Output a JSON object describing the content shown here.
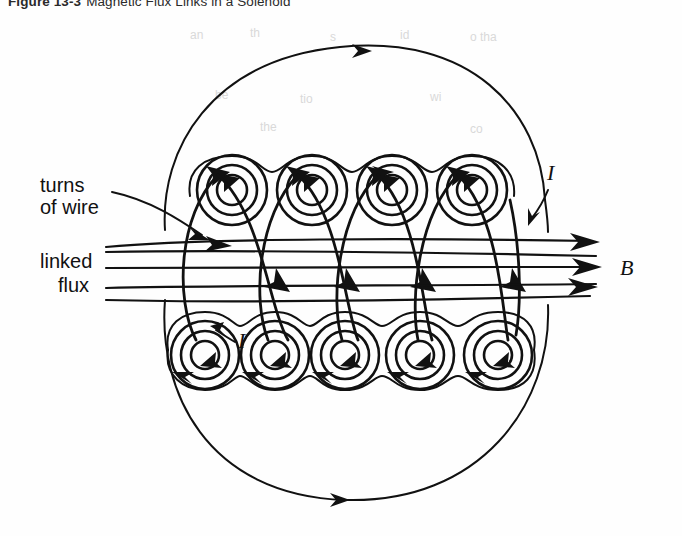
{
  "figure": {
    "number": "Figure 13-3",
    "caption": "Magnetic Flux Links in a Solenoid"
  },
  "labels": {
    "turns_line1": "turns",
    "turns_line2": "of wire",
    "linked_line1": "linked",
    "linked_line2": "flux",
    "current_top": "I",
    "current_bottom": "I",
    "field_symbol": "B"
  },
  "colors": {
    "ink": "#111111",
    "background": "#ffffff",
    "bleed_through": "#d9d9d9"
  },
  "diagram": {
    "type": "physics-field-diagram",
    "top_coil_count": 4,
    "bottom_coil_count": 5,
    "wire_loop_count": 5,
    "flux_line_count": 5,
    "flux_direction": "left (outside), right (inside core)",
    "current_direction_top": "into page / counterclockwise circulation",
    "current_direction_bottom": "out of page / clockwise circulation",
    "top_coil_centers_x": [
      232,
      312,
      392,
      472
    ],
    "bottom_coil_centers_x": [
      205,
      275,
      345,
      420,
      498
    ],
    "coil_row_y_top": 190,
    "coil_row_y_bottom": 355,
    "outer_envelope": "closed flux boundary around entire solenoid"
  },
  "bleed_through_text": [
    "an",
    "th",
    "s",
    "id",
    "o tha",
    "be",
    "tio",
    "wi",
    "the",
    "co"
  ]
}
